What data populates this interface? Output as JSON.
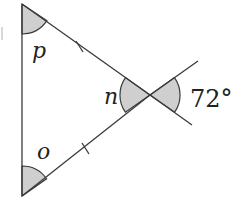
{
  "figure": {
    "type": "geometry-diagram",
    "vertices": {
      "top": {
        "x": 22,
        "y": 4
      },
      "intersection": {
        "x": 150,
        "y": 95
      },
      "bottom": {
        "x": 22,
        "y": 196
      }
    },
    "extension_ends": {
      "upper_right": {
        "x": 198,
        "y": 61
      },
      "lower_right": {
        "x": 192,
        "y": 125
      }
    },
    "labels": {
      "angle_top": "p",
      "angle_bottom": "o",
      "angle_interior_right": "n",
      "angle_exterior": "72°"
    },
    "equal_side_marks": 2,
    "colors": {
      "line": "#3a3a3a",
      "shading": "#cfcfcf",
      "background": "#ffffff"
    }
  }
}
